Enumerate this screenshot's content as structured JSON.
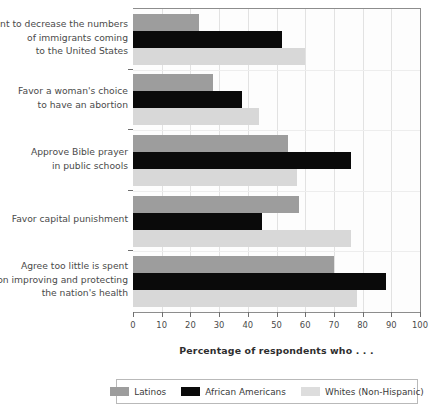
{
  "chart_data": {
    "type": "bar",
    "orientation": "horizontal",
    "title": "",
    "subtitle": "",
    "xlabel": "Percentage of respondents who . . .",
    "ylabel": "",
    "xlim": [
      0,
      100
    ],
    "xticks": [
      0,
      10,
      20,
      30,
      40,
      50,
      60,
      70,
      80,
      90,
      100
    ],
    "xtick_labels": [
      "0",
      "10",
      "20",
      "30",
      "40",
      "50",
      "60",
      "70",
      "80",
      "90",
      "100"
    ],
    "grid": "vertical",
    "legend_position": "bottom",
    "categories": [
      "Want to decrease the numbers of immigrants coming to the United States",
      "Favor a woman's choice to have an abortion",
      "Approve Bible prayer in public schools",
      "Favor capital punishment",
      "Agree too little is spent on improving and protecting the nation's health"
    ],
    "category_lines": [
      [
        "Want to decrease the numbers",
        "of immigrants coming",
        "to the United States"
      ],
      [
        "Favor a woman's choice",
        "to have an abortion"
      ],
      [
        "Approve Bible prayer",
        "in public schools"
      ],
      [
        "Favor capital punishment"
      ],
      [
        "Agree too little is spent",
        "on improving and protecting",
        "the nation's health"
      ]
    ],
    "series": [
      {
        "name": "Latinos",
        "color": "#9d9d9d",
        "values": [
          23,
          28,
          54,
          58,
          70
        ]
      },
      {
        "name": "African Americans",
        "color": "#0a0a0a",
        "values": [
          52,
          38,
          76,
          45,
          88
        ]
      },
      {
        "name": "Whites (Non-Hispanic)",
        "color": "#d8d8d8",
        "values": [
          60,
          44,
          57,
          76,
          78
        ]
      }
    ]
  },
  "legend": {
    "items": [
      {
        "label": "Latinos"
      },
      {
        "label": "African Americans"
      },
      {
        "label": "Whites (Non-Hispanic)"
      }
    ]
  }
}
